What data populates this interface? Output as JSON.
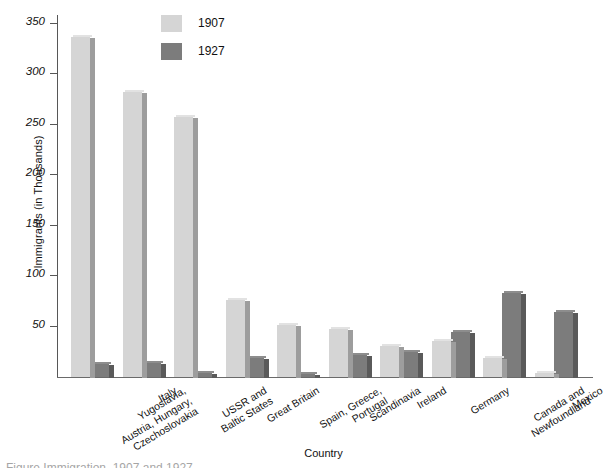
{
  "chart_data": {
    "type": "bar",
    "title": "",
    "xlabel": "Country",
    "ylabel": "Immigrants (in Thousands)",
    "ylim": [
      0,
      350
    ],
    "yticks": [
      50,
      100,
      150,
      200,
      250,
      300,
      350
    ],
    "grid": false,
    "legend_position": "top-center",
    "categories": [
      "Yugoslavia, Austria, Hungary, Czechoslovakia",
      "Italy",
      "USSR and Baltic States",
      "Great Britain",
      "Spain, Greece, Portugal",
      "Scandinavia",
      "Ireland",
      "Germany",
      "Canada and Newfoundland",
      "Mexico"
    ],
    "category_lines": [
      [
        "Yugoslavia,",
        "Austria, Hungary,",
        "Czechoslovakia"
      ],
      [
        "Italy"
      ],
      [
        "USSR and",
        "Baltic States"
      ],
      [
        "Great Britain"
      ],
      [
        "Spain, Greece,",
        "Portugal"
      ],
      [
        "Scandinavia"
      ],
      [
        "Ireland"
      ],
      [
        "Germany"
      ],
      [
        "Canada and",
        "Newfoundland"
      ],
      [
        "Mexico"
      ]
    ],
    "series": [
      {
        "name": "1907",
        "color": "#d5d5d5",
        "values": [
          337,
          283,
          258,
          76,
          52,
          48,
          31,
          36,
          19,
          4
        ]
      },
      {
        "name": "1927",
        "color": "#7c7c7c",
        "values": [
          13,
          14,
          4,
          19,
          3,
          22,
          25,
          45,
          83,
          64
        ]
      }
    ]
  },
  "axis": {
    "y_title": "Immigrants (in Thousands)",
    "x_title": "Country",
    "tick_labels": [
      "350",
      "300",
      "250",
      "200",
      "150",
      "100",
      "50"
    ]
  },
  "legend": {
    "items": [
      {
        "label": "1907",
        "swatch": "light-gray-swatch-icon"
      },
      {
        "label": "1927",
        "swatch": "dark-gray-swatch-icon"
      }
    ]
  },
  "caption": {
    "text": "Figure  Immigration, 1907 and 1927"
  }
}
